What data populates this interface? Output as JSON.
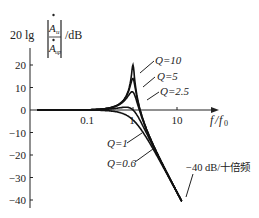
{
  "chart_data": {
    "type": "line",
    "title": "",
    "ylabel": "20 lg|Ȧu/Ȧup| /dB",
    "ylabel_parts": {
      "prefix": "20 lg",
      "numerator": "A",
      "numerator_sub": "u",
      "denominator": "A",
      "denominator_sub": "up",
      "unit": "/dB"
    },
    "xlabel": "f/f0",
    "x_scale": "log",
    "xlim": [
      0.01,
      30
    ],
    "ylim": [
      -40,
      25
    ],
    "x_ticks": [
      {
        "value": 0.1,
        "label": "0.1"
      },
      {
        "value": 1,
        "label": "1"
      },
      {
        "value": 10,
        "label": "10"
      }
    ],
    "y_ticks": [
      {
        "value": 20,
        "label": "20"
      },
      {
        "value": 10,
        "label": "10"
      },
      {
        "value": 0,
        "label": "0"
      },
      {
        "value": -10,
        "label": "-10"
      },
      {
        "value": -20,
        "label": "-20"
      },
      {
        "value": -30,
        "label": "-30"
      },
      {
        "value": -40,
        "label": "-40"
      }
    ],
    "grid": false,
    "legend": "inline annotations",
    "series": [
      {
        "name": "Q=10",
        "Q": 10,
        "peak_db": 20
      },
      {
        "name": "Q=5",
        "Q": 5,
        "peak_db": 14
      },
      {
        "name": "Q=2.5",
        "Q": 2.5,
        "peak_db": 8
      },
      {
        "name": "Q=1",
        "Q": 1,
        "peak_db": 0
      },
      {
        "name": "Q=0.6",
        "Q": 0.6,
        "peak_db": -4.4
      }
    ],
    "annotations": [
      {
        "text": "Q=10"
      },
      {
        "text": "Q=5"
      },
      {
        "text": "Q=2.5"
      },
      {
        "text": "Q=1"
      },
      {
        "text": "Q=0.6"
      },
      {
        "text": "−40 dB/十倍频"
      }
    ]
  },
  "labels": {
    "ylabel_prefix": "20 lg",
    "ylabel_num": "A",
    "ylabel_num_sub": "u",
    "ylabel_den": "A",
    "ylabel_den_sub": "up",
    "ylabel_unit": "/dB",
    "xlabel_f": "f",
    "xlabel_slash": "/",
    "xlabel_f0": "f",
    "xlabel_f0_sub": "0",
    "q10": "Q=10",
    "q5": "Q=5",
    "q25": "Q=2.5",
    "q1": "Q=1",
    "q06": "Q=0.6",
    "slope": "−40 dB/十倍频",
    "xt_01": "0.1",
    "xt_1": "1",
    "xt_10": "10",
    "yt_20": "20",
    "yt_10": "10",
    "yt_0": "0",
    "yt_m10": "−10",
    "yt_m20": "−20",
    "yt_m30": "−30",
    "yt_m40": "−40"
  }
}
